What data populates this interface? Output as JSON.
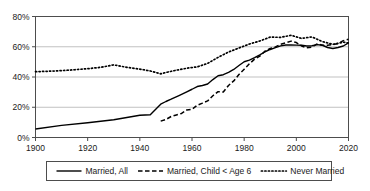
{
  "chart_data": {
    "type": "line",
    "title": "",
    "xlabel": "",
    "ylabel": "",
    "xlim": [
      1900,
      2020
    ],
    "ylim": [
      0,
      80
    ],
    "grid": true,
    "legend_position": "bottom",
    "x_tick_labels": [
      "1900",
      "1920",
      "1940",
      "1960",
      "1980",
      "2000",
      "2020"
    ],
    "x_ticks": [
      1900,
      1920,
      1940,
      1960,
      1980,
      2000,
      2020
    ],
    "y_tick_labels": [
      "0%",
      "20%",
      "40%",
      "60%",
      "80%"
    ],
    "y_ticks": [
      0,
      20,
      40,
      60,
      80
    ],
    "series": [
      {
        "name": "Married, All",
        "style": "solid",
        "color": "#000000",
        "x": [
          1900,
          1910,
          1920,
          1930,
          1940,
          1944,
          1948,
          1950,
          1952,
          1955,
          1958,
          1960,
          1962,
          1964,
          1966,
          1968,
          1970,
          1972,
          1974,
          1976,
          1978,
          1980,
          1982,
          1984,
          1986,
          1988,
          1990,
          1992,
          1994,
          1996,
          1998,
          2000,
          2002,
          2004,
          2006,
          2008,
          2010,
          2012,
          2014,
          2016,
          2018,
          2020
        ],
        "values": [
          5.6,
          8.0,
          9.8,
          11.7,
          14.7,
          15.0,
          22.0,
          23.8,
          25.3,
          27.7,
          30.2,
          31.9,
          33.7,
          34.4,
          35.4,
          38.3,
          40.8,
          41.5,
          43.0,
          45.0,
          47.6,
          50.1,
          51.2,
          52.8,
          54.6,
          56.7,
          58.2,
          59.4,
          60.6,
          61.2,
          61.2,
          61.1,
          61.0,
          60.5,
          60.7,
          61.4,
          61.0,
          59.5,
          58.8,
          59.5,
          60.5,
          62.6
        ]
      },
      {
        "name": "Married, Child < Age 6",
        "style": "dashed",
        "color": "#000000",
        "x": [
          1948,
          1950,
          1952,
          1954,
          1956,
          1958,
          1960,
          1962,
          1964,
          1966,
          1968,
          1970,
          1972,
          1974,
          1976,
          1978,
          1980,
          1982,
          1984,
          1986,
          1988,
          1990,
          1992,
          1994,
          1996,
          1998,
          2000,
          2002,
          2004,
          2006,
          2008,
          2010,
          2012,
          2014,
          2016,
          2018,
          2020
        ],
        "values": [
          10.8,
          11.9,
          13.9,
          14.9,
          15.9,
          18.2,
          18.6,
          21.3,
          22.7,
          24.2,
          27.6,
          30.3,
          30.1,
          34.4,
          37.4,
          41.6,
          45.1,
          48.7,
          51.8,
          53.8,
          57.1,
          58.9,
          59.9,
          61.7,
          62.7,
          63.7,
          62.8,
          60.5,
          59.3,
          59.8,
          61.9,
          61.0,
          61.0,
          61.4,
          62.2,
          64.0,
          65.0
        ]
      },
      {
        "name": "Never Married",
        "style": "dotted",
        "color": "#000000",
        "x": [
          1900,
          1905,
          1910,
          1915,
          1920,
          1925,
          1930,
          1935,
          1940,
          1944,
          1948,
          1950,
          1954,
          1958,
          1962,
          1966,
          1970,
          1974,
          1978,
          1982,
          1986,
          1990,
          1994,
          1998,
          2002,
          2006,
          2010,
          2014,
          2018,
          2020
        ],
        "values": [
          43.5,
          43.8,
          44.2,
          44.8,
          45.5,
          46.4,
          48.0,
          46.4,
          45.2,
          44.0,
          42.1,
          43.0,
          44.5,
          45.8,
          46.7,
          49.0,
          53.0,
          56.5,
          59.2,
          61.8,
          63.8,
          66.4,
          66.2,
          67.6,
          65.5,
          66.5,
          63.4,
          61.6,
          63.0,
          62.5
        ]
      }
    ]
  },
  "legend": {
    "entries": [
      {
        "label": "Married, All",
        "style": "solid"
      },
      {
        "label": "Married, Child < Age 6",
        "style": "dashed"
      },
      {
        "label": "Never Married",
        "style": "dotted"
      }
    ]
  }
}
